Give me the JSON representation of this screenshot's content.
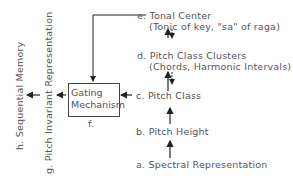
{
  "diagram": {
    "levels": [
      {
        "id": "e",
        "prefix": "e.",
        "label": "Tonal  Center",
        "sublabel": "(Tonic of key, \"sa\" of raga)"
      },
      {
        "id": "d",
        "prefix": "d.",
        "label": "Pitch Class Clusters",
        "sublabel": "(Chords, Harmonic Intervals)"
      },
      {
        "id": "c",
        "prefix": "c.",
        "label": "Pitch Class"
      },
      {
        "id": "b",
        "prefix": "b.",
        "label": "Pitch Height"
      },
      {
        "id": "a",
        "prefix": "a.",
        "label": "Spectral Representation"
      }
    ],
    "gating": {
      "line1": "Gating",
      "line2": "Mechanism",
      "tag": "f."
    },
    "outputs": [
      {
        "id": "g",
        "label": "g. Pitch Invariant Representation"
      },
      {
        "id": "h",
        "label": "h. Sequential Memory"
      }
    ],
    "line_color": "#222222",
    "text_color": "#555555"
  }
}
